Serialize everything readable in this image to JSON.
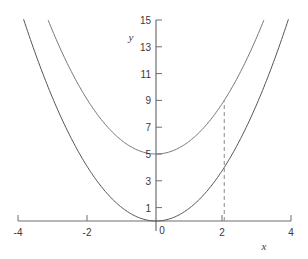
{
  "chart_data": {
    "type": "line",
    "title": "",
    "xlabel": "x",
    "ylabel": "y",
    "xlim": [
      -4,
      4
    ],
    "ylim": [
      0,
      15
    ],
    "grid": false,
    "legend": "none",
    "x_ticks": [
      -4,
      -2,
      0,
      2,
      4
    ],
    "x_tick_labels": [
      "-4",
      "-2",
      "0",
      "2",
      "4"
    ],
    "y_ticks": [
      1,
      3,
      5,
      7,
      9,
      11,
      13,
      15
    ],
    "y_tick_labels": [
      "1",
      "3",
      "5",
      "7",
      "9",
      "11",
      "13",
      "15"
    ],
    "series": [
      {
        "name": "y = x^2",
        "expression": "x^2",
        "vertex": [
          0,
          0
        ],
        "color": "#555555",
        "x": [
          -4,
          -3.5,
          -3,
          -2.5,
          -2,
          -1.5,
          -1,
          -0.5,
          0,
          0.5,
          1,
          1.5,
          2,
          2.5,
          3,
          3.5,
          4
        ],
        "values": [
          16,
          12.25,
          9,
          6.25,
          4,
          2.25,
          1,
          0.25,
          0,
          0.25,
          1,
          2.25,
          4,
          6.25,
          9,
          12.25,
          16
        ]
      },
      {
        "name": "y = x^2 + 5",
        "expression": "x^2 + 5",
        "vertex": [
          0,
          5
        ],
        "color": "#777777",
        "x": [
          -4,
          -3.5,
          -3,
          -2.5,
          -2,
          -1.5,
          -1,
          -0.5,
          0,
          0.5,
          1,
          1.5,
          2,
          2.5,
          3,
          3.5,
          4
        ],
        "values": [
          21,
          17.25,
          14,
          11.25,
          9,
          7.25,
          6,
          5.25,
          5,
          5.25,
          6,
          7.25,
          9,
          11.25,
          14,
          17.25,
          21
        ]
      }
    ],
    "annotations": [
      {
        "type": "dashed-vertical-segment",
        "x": 2,
        "y_from": 0,
        "y_to": 9,
        "color": "#8a8a8a",
        "note": "drop line at x = 2 meeting upper parabola at y = 9"
      }
    ]
  },
  "axes": {
    "x_axis_label": "x",
    "y_axis_label": "y",
    "origin_label": "0"
  }
}
